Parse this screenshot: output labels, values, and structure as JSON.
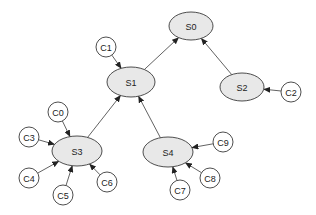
{
  "diagram": {
    "type": "directed-graph",
    "colors": {
      "server_fill": "#e8e8e8",
      "client_fill": "#ffffff",
      "stroke": "#3a3a3a"
    },
    "nodes": [
      {
        "id": "S0",
        "label": "S0",
        "shape": "ellipse",
        "cx": 191,
        "cy": 26,
        "rx": 22,
        "ry": 14
      },
      {
        "id": "S1",
        "label": "S1",
        "shape": "ellipse",
        "cx": 131,
        "cy": 82,
        "rx": 24,
        "ry": 15
      },
      {
        "id": "S2",
        "label": "S2",
        "shape": "ellipse",
        "cx": 242,
        "cy": 87,
        "rx": 22,
        "ry": 14
      },
      {
        "id": "S3",
        "label": "S3",
        "shape": "ellipse",
        "cx": 77,
        "cy": 151,
        "rx": 25,
        "ry": 15
      },
      {
        "id": "S4",
        "label": "S4",
        "shape": "ellipse",
        "cx": 168,
        "cy": 152,
        "rx": 25,
        "ry": 15
      },
      {
        "id": "C0",
        "label": "C0",
        "shape": "circle",
        "cx": 58,
        "cy": 112,
        "r": 10
      },
      {
        "id": "C1",
        "label": "C1",
        "shape": "circle",
        "cx": 106,
        "cy": 47,
        "r": 10
      },
      {
        "id": "C2",
        "label": "C2",
        "shape": "circle",
        "cx": 291,
        "cy": 92,
        "r": 10
      },
      {
        "id": "C3",
        "label": "C3",
        "shape": "circle",
        "cx": 29,
        "cy": 137,
        "r": 10
      },
      {
        "id": "C4",
        "label": "C4",
        "shape": "circle",
        "cx": 29,
        "cy": 178,
        "r": 10
      },
      {
        "id": "C5",
        "label": "C5",
        "shape": "circle",
        "cx": 63,
        "cy": 195,
        "r": 10
      },
      {
        "id": "C6",
        "label": "C6",
        "shape": "circle",
        "cx": 107,
        "cy": 182,
        "r": 10
      },
      {
        "id": "C7",
        "label": "C7",
        "shape": "circle",
        "cx": 180,
        "cy": 190,
        "r": 10
      },
      {
        "id": "C8",
        "label": "C8",
        "shape": "circle",
        "cx": 210,
        "cy": 178,
        "r": 10
      },
      {
        "id": "C9",
        "label": "C9",
        "shape": "circle",
        "cx": 223,
        "cy": 142,
        "r": 10
      }
    ],
    "edges": [
      {
        "from": "S1",
        "to": "S0"
      },
      {
        "from": "S2",
        "to": "S0"
      },
      {
        "from": "C1",
        "to": "S1"
      },
      {
        "from": "S3",
        "to": "S1"
      },
      {
        "from": "S4",
        "to": "S1"
      },
      {
        "from": "C2",
        "to": "S2"
      },
      {
        "from": "C0",
        "to": "S3"
      },
      {
        "from": "C3",
        "to": "S3"
      },
      {
        "from": "C4",
        "to": "S3"
      },
      {
        "from": "C5",
        "to": "S3"
      },
      {
        "from": "C6",
        "to": "S3"
      },
      {
        "from": "C7",
        "to": "S4"
      },
      {
        "from": "C8",
        "to": "S4"
      },
      {
        "from": "C9",
        "to": "S4"
      }
    ]
  }
}
